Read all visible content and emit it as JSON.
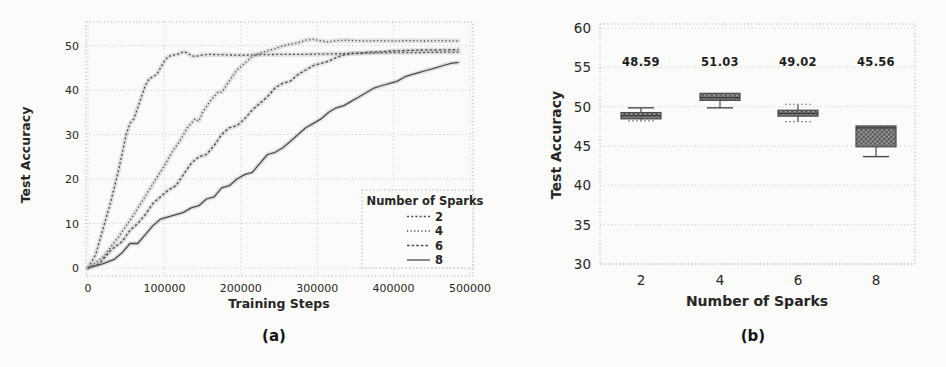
{
  "colors": {
    "line": "#4a4a4a",
    "halo": "#9a9a9a",
    "grid": "#c2c2c2",
    "frame": "#a5a5a5",
    "text": "#262626",
    "box_dark": "#515151",
    "box_light": "#9b9b9b",
    "background": "#fbfbf9"
  },
  "chart_data": [
    {
      "type": "line",
      "caption": "(a)",
      "title": "",
      "xlabel": "Training Steps",
      "ylabel": "Test Accuracy",
      "xlim": [
        0,
        500000
      ],
      "ylim": [
        0,
        52
      ],
      "xticks": [
        0,
        100000,
        200000,
        300000,
        400000,
        500000
      ],
      "xtick_labels": [
        "0",
        "100000",
        "200000",
        "300000",
        "400000",
        "500000"
      ],
      "yticks": [
        0,
        10,
        20,
        30,
        40,
        50
      ],
      "ytick_labels": [
        "0",
        "10",
        "20",
        "30",
        "40",
        "50"
      ],
      "grid": true,
      "legend": {
        "title": "Number of Sparks",
        "position": "lower right",
        "entries": [
          "2",
          "4",
          "6",
          "8"
        ]
      },
      "series": [
        {
          "name": "2",
          "style": "dotted",
          "dash": "2 2.2",
          "points": [
            [
              0,
              0
            ],
            [
              10000,
              3
            ],
            [
              20000,
              9
            ],
            [
              30000,
              15
            ],
            [
              40000,
              22
            ],
            [
              45000,
              26
            ],
            [
              50000,
              30
            ],
            [
              55000,
              32.5
            ],
            [
              60000,
              33.5
            ],
            [
              65000,
              36
            ],
            [
              70000,
              38.5
            ],
            [
              75000,
              41
            ],
            [
              80000,
              42.5
            ],
            [
              85000,
              43
            ],
            [
              90000,
              43.5
            ],
            [
              95000,
              45
            ],
            [
              100000,
              46.5
            ],
            [
              105000,
              47.5
            ],
            [
              110000,
              47.8
            ],
            [
              115000,
              47.9
            ],
            [
              120000,
              48.2
            ],
            [
              125000,
              48.6
            ],
            [
              130000,
              48.3
            ],
            [
              135000,
              47.8
            ],
            [
              140000,
              47.5
            ],
            [
              145000,
              47.7
            ],
            [
              150000,
              47.9
            ],
            [
              160000,
              48
            ],
            [
              180000,
              47.9
            ],
            [
              200000,
              47.8
            ],
            [
              220000,
              47.9
            ],
            [
              250000,
              48
            ],
            [
              280000,
              48
            ],
            [
              310000,
              48.1
            ],
            [
              340000,
              48.2
            ],
            [
              370000,
              48.3
            ],
            [
              400000,
              48.4
            ],
            [
              430000,
              48.4
            ],
            [
              460000,
              48.5
            ],
            [
              485000,
              48.5
            ]
          ]
        },
        {
          "name": "4",
          "style": "dotted",
          "dash": "1.2 2.4",
          "points": [
            [
              0,
              0
            ],
            [
              20000,
              2.5
            ],
            [
              40000,
              7
            ],
            [
              60000,
              12
            ],
            [
              80000,
              17.5
            ],
            [
              100000,
              23
            ],
            [
              110000,
              26
            ],
            [
              120000,
              28.5
            ],
            [
              130000,
              31.5
            ],
            [
              140000,
              33.5
            ],
            [
              145000,
              33
            ],
            [
              150000,
              35
            ],
            [
              160000,
              37.5
            ],
            [
              170000,
              39.5
            ],
            [
              175000,
              39.5
            ],
            [
              185000,
              42
            ],
            [
              195000,
              44.5
            ],
            [
              205000,
              46
            ],
            [
              215000,
              47.5
            ],
            [
              225000,
              48.3
            ],
            [
              235000,
              48.8
            ],
            [
              245000,
              49.3
            ],
            [
              255000,
              49.9
            ],
            [
              265000,
              50.3
            ],
            [
              275000,
              50.6
            ],
            [
              285000,
              51.2
            ],
            [
              295000,
              51.4
            ],
            [
              305000,
              51
            ],
            [
              315000,
              50.8
            ],
            [
              325000,
              51.1
            ],
            [
              340000,
              51.2
            ],
            [
              360000,
              51
            ],
            [
              380000,
              51.1
            ],
            [
              400000,
              51
            ],
            [
              420000,
              51.1
            ],
            [
              440000,
              51
            ],
            [
              460000,
              51.1
            ],
            [
              485000,
              51
            ]
          ]
        },
        {
          "name": "6",
          "style": "dotted",
          "dash": "2.6 2",
          "points": [
            [
              0,
              0
            ],
            [
              15000,
              1
            ],
            [
              30000,
              4
            ],
            [
              45000,
              6
            ],
            [
              55000,
              8.5
            ],
            [
              65000,
              10
            ],
            [
              75000,
              12
            ],
            [
              85000,
              14.5
            ],
            [
              95000,
              16
            ],
            [
              105000,
              17.5
            ],
            [
              115000,
              18.5
            ],
            [
              125000,
              21
            ],
            [
              135000,
              23.5
            ],
            [
              145000,
              25
            ],
            [
              155000,
              25.5
            ],
            [
              165000,
              27.5
            ],
            [
              175000,
              30
            ],
            [
              185000,
              31.5
            ],
            [
              195000,
              32
            ],
            [
              205000,
              33.5
            ],
            [
              215000,
              35.5
            ],
            [
              225000,
              37
            ],
            [
              235000,
              38.5
            ],
            [
              245000,
              40.5
            ],
            [
              255000,
              41.5
            ],
            [
              265000,
              42
            ],
            [
              275000,
              43.5
            ],
            [
              285000,
              44.5
            ],
            [
              295000,
              45.5
            ],
            [
              305000,
              46
            ],
            [
              315000,
              46.5
            ],
            [
              325000,
              47.3
            ],
            [
              335000,
              47.9
            ],
            [
              345000,
              48.2
            ],
            [
              355000,
              48.3
            ],
            [
              370000,
              48.5
            ],
            [
              385000,
              48.6
            ],
            [
              400000,
              48.8
            ],
            [
              420000,
              48.9
            ],
            [
              440000,
              49
            ],
            [
              465000,
              49
            ],
            [
              485000,
              49.1
            ]
          ]
        },
        {
          "name": "8",
          "style": "solid",
          "dash": "",
          "points": [
            [
              0,
              0
            ],
            [
              20000,
              1
            ],
            [
              35000,
              2
            ],
            [
              45000,
              3.5
            ],
            [
              55000,
              5.5
            ],
            [
              65000,
              5.5
            ],
            [
              75000,
              7.5
            ],
            [
              85000,
              9.5
            ],
            [
              95000,
              11
            ],
            [
              105000,
              11.5
            ],
            [
              115000,
              12
            ],
            [
              125000,
              12.5
            ],
            [
              135000,
              13.5
            ],
            [
              145000,
              14
            ],
            [
              155000,
              15.5
            ],
            [
              165000,
              16
            ],
            [
              175000,
              18
            ],
            [
              185000,
              18.5
            ],
            [
              195000,
              20
            ],
            [
              205000,
              21
            ],
            [
              215000,
              21.5
            ],
            [
              225000,
              23.5
            ],
            [
              235000,
              25.5
            ],
            [
              245000,
              26
            ],
            [
              255000,
              27
            ],
            [
              265000,
              28.5
            ],
            [
              275000,
              30
            ],
            [
              285000,
              31.5
            ],
            [
              295000,
              32.5
            ],
            [
              305000,
              33.5
            ],
            [
              315000,
              35
            ],
            [
              325000,
              36
            ],
            [
              335000,
              36.5
            ],
            [
              345000,
              37.5
            ],
            [
              355000,
              38.5
            ],
            [
              365000,
              39.5
            ],
            [
              375000,
              40.5
            ],
            [
              385000,
              41
            ],
            [
              395000,
              41.5
            ],
            [
              405000,
              42
            ],
            [
              415000,
              43
            ],
            [
              425000,
              43.5
            ],
            [
              435000,
              44
            ],
            [
              445000,
              44.5
            ],
            [
              455000,
              45
            ],
            [
              465000,
              45.5
            ],
            [
              475000,
              46
            ],
            [
              485000,
              46.2
            ]
          ]
        }
      ]
    },
    {
      "type": "box",
      "caption": "(b)",
      "title": "",
      "xlabel": "Number of Sparks",
      "ylabel": "Test Accuracy",
      "ylim": [
        30,
        60
      ],
      "yticks": [
        30,
        35,
        40,
        45,
        50,
        55,
        60
      ],
      "ytick_labels": [
        "30",
        "35",
        "40",
        "45",
        "50",
        "55",
        "60"
      ],
      "categories": [
        "2",
        "4",
        "6",
        "8"
      ],
      "grid": true,
      "boxes": [
        {
          "category": "2",
          "mean_label": "48.59",
          "whisker_low": 48.2,
          "q1": 48.45,
          "median": 48.85,
          "q3": 49.25,
          "whisker_high": 49.85,
          "cap_high": "solid",
          "cap_low": "dashed"
        },
        {
          "category": "4",
          "mean_label": "51.03",
          "whisker_low": 49.85,
          "q1": 50.8,
          "median": 51.15,
          "q3": 51.7,
          "whisker_high": 51.7,
          "cap_high": "none",
          "cap_low": "solid"
        },
        {
          "category": "6",
          "mean_label": "49.02",
          "whisker_low": 48.1,
          "q1": 48.8,
          "median": 49.15,
          "q3": 49.55,
          "whisker_high": 50.3,
          "cap_high": "dashed",
          "cap_low": "dashed"
        },
        {
          "category": "8",
          "mean_label": "45.56",
          "whisker_low": 43.65,
          "q1": 44.9,
          "median": 47.3,
          "q3": 47.55,
          "whisker_high": 47.55,
          "cap_high": "none",
          "cap_low": "solid"
        }
      ]
    }
  ]
}
